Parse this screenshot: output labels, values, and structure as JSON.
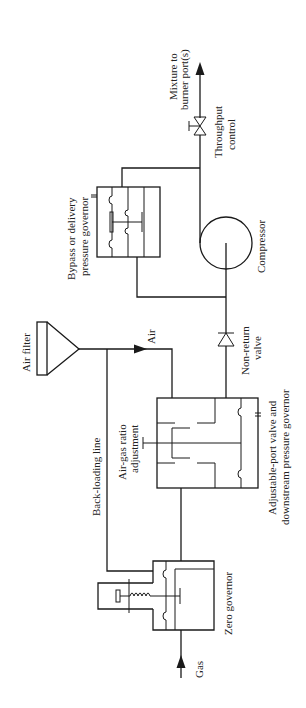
{
  "diagram": {
    "type": "process-flow / piping schematic",
    "orientation": "rotated 90 degrees counter-clockwise",
    "colors": {
      "line": "#1a1a1a",
      "background": "#ffffff"
    },
    "labels": {
      "mixture_line1": "Mixture to",
      "mixture_line2": "burner port(s)",
      "throughput_line1": "Throughput",
      "throughput_line2": "control",
      "bypass_line1": "Bypass or delivery",
      "bypass_line2": "pressure governor",
      "compressor": "Compressor",
      "air_filter": "Air filter",
      "air": "Air",
      "nonreturn_line1": "Non-return",
      "nonreturn_line2": "valve",
      "backloading": "Back-loading line",
      "airgas_line1": "Air-gas ratio",
      "airgas_line2": "adjustment",
      "adjport_line1": "Adjustable-port valve and",
      "adjport_line2": "downstream pressure governor",
      "zero_governor": "Zero governor",
      "gas": "Gas"
    },
    "components": [
      "gas-inlet",
      "zero-governor",
      "back-loading-line",
      "air-filter",
      "adjustable-port-valve-and-downstream-pressure-governor",
      "air-gas-ratio-adjustment",
      "non-return-valve",
      "compressor",
      "bypass-or-delivery-pressure-governor",
      "throughput-control-valve",
      "mixture-outlet"
    ]
  }
}
